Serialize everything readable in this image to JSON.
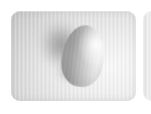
{
  "scene": {
    "width": 151,
    "height": 114,
    "background_color": "#ffffff",
    "description": "Grayscale render of a smooth egg-shaped solid resting on a lightly textured rounded panel, lit from the right so a soft shadow falls up and to the left."
  },
  "panel": {
    "name": "textured-surface-panel",
    "fill_color": "#d6d6d6",
    "highlight_color": "#f2f2f2",
    "shade_color": "#a8a8a8",
    "corner_radius": 9,
    "x": 11,
    "y": 11,
    "width": 125,
    "height": 90,
    "texture": "vertical-stripe"
  },
  "object": {
    "name": "ovoid-solid",
    "shape": "egg",
    "x": 62,
    "y": 25,
    "width": 42,
    "height": 62,
    "rotation_deg": 7,
    "highlight_color": "#efefef",
    "midtone_color": "#b6b6b6",
    "terminator_color": "#7e7e7e",
    "specular_color": "#ffffff"
  },
  "shadow": {
    "name": "cast-shadow",
    "direction": "upper-left",
    "x": 24,
    "y": 8,
    "width": 62,
    "height": 68,
    "rotation_deg": -24,
    "core_color": "#7a7a7a",
    "falloff_color": "#d6d6d6"
  },
  "contact_shadow": {
    "name": "contact-shadow",
    "x": 56,
    "y": 58,
    "width": 34,
    "height": 26,
    "core_color": "#6e6e6e"
  },
  "adjacent_panel": {
    "name": "adjacent-panel-sliver",
    "x": 143,
    "y": 11,
    "width": 12,
    "height": 90,
    "fill_color": "#ededed",
    "corner_radius": 9
  },
  "light": {
    "name": "key-light",
    "direction": "right",
    "elevation": "high"
  }
}
